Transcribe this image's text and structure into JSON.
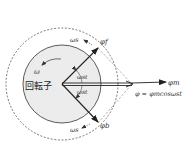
{
  "diagram": {
    "rotor_label": "回転子",
    "omega_label": "ω",
    "omega_s_top": "ωs",
    "omega_s_bottom": "ωs",
    "phi_f": "φf",
    "phi_b": "φb",
    "phi_m": "φm",
    "angle_top": "ωst",
    "angle_bottom": "ωst",
    "equation": "φ = φmcosωst"
  },
  "colors": {
    "rotor_fill": "#ececec",
    "line": "#222222",
    "dashed": "#555555",
    "guide": "#999999"
  }
}
